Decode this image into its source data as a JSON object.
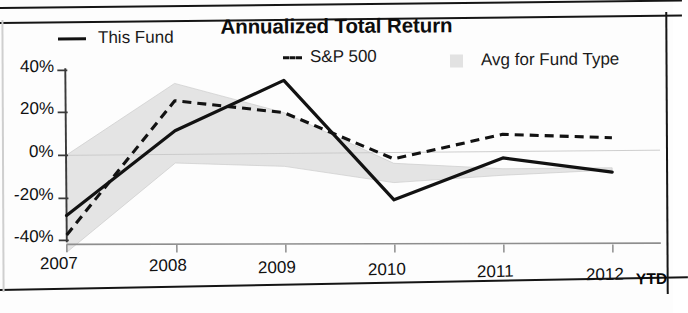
{
  "chart_data": {
    "type": "line",
    "title": "Annualized Total Return",
    "xlabel": "",
    "ylabel": "",
    "categories": [
      "2007",
      "2008",
      "2009",
      "2010",
      "2011",
      "2012"
    ],
    "x_axis_suffix": "YTD",
    "ylim": [
      -40,
      40
    ],
    "ytick_values": [
      40,
      20,
      0,
      -20,
      -40
    ],
    "ytick_labels": [
      "40%",
      "20%",
      "0%",
      "-20%",
      "-40%"
    ],
    "grid": false,
    "legend_position": "top",
    "series": [
      {
        "name": "This Fund",
        "style": "solid",
        "color": "#121212",
        "values": [
          -28,
          11,
          34,
          -22,
          -3,
          -10
        ]
      },
      {
        "name": "S&P 500",
        "style": "dashed",
        "color": "#121212",
        "values": [
          -37,
          25,
          19,
          -3,
          8,
          6
        ]
      },
      {
        "name": "Avg for Fund Type",
        "style": "band",
        "color": "#e2e2e2",
        "upper": [
          0,
          33,
          19,
          -5,
          -8,
          -8
        ],
        "lower": [
          -45,
          -4,
          -6,
          -14,
          -11,
          -9
        ]
      }
    ]
  },
  "legend": {
    "items": [
      {
        "label": "This Fund",
        "marker": "solid-line-swatch"
      },
      {
        "label": "S&P 500",
        "marker": "dashed-line-swatch"
      },
      {
        "label": "Avg for Fund Type",
        "marker": "gray-box-swatch"
      }
    ]
  },
  "axes": {
    "y_ticks": [
      "40%",
      "20%",
      "0%",
      "-20%",
      "-40%"
    ],
    "x_ticks": [
      "2007",
      "2008",
      "2009",
      "2010",
      "2011",
      "2012"
    ],
    "x_suffix": "YTD"
  }
}
